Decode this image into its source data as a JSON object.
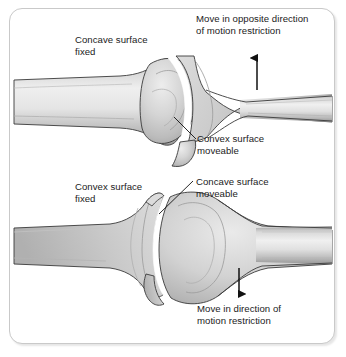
{
  "figure": {
    "border_color": "#c9c9c9",
    "background_color": "#ffffff",
    "bone_fill_light": "#e2e2e2",
    "bone_fill_mid": "#c4c4c4",
    "bone_fill_dark": "#9a9a9a",
    "outline_color": "#2b2b2b",
    "joint_space_color": "#ffffff",
    "text_color": "#1b1b1b"
  },
  "panels": [
    {
      "id": "top-panel",
      "name": "concave-fixed-convex-moveable",
      "labels": {
        "fixed_surface": "Concave surface\nfixed",
        "moveable_surface": "Convex surface\nmoveable",
        "direction_note": "Move in opposite direction\nof motion restriction"
      },
      "arrow": {
        "name": "up-arrow",
        "direction": "up",
        "x": 257,
        "y_tail": 90,
        "y_head": 52
      }
    },
    {
      "id": "bottom-panel",
      "name": "convex-fixed-concave-moveable",
      "labels": {
        "fixed_surface": "Convex surface\nfixed",
        "moveable_surface": "Concave surface\nmoveable",
        "direction_note": "Move in direction of\nmotion restriction"
      },
      "arrow": {
        "name": "down-arrow",
        "direction": "down",
        "x": 239,
        "y_tail": 268,
        "y_head": 300
      }
    }
  ],
  "leader_lines": [
    {
      "name": "leader-convex-moveable",
      "x1": 174,
      "y1": 117,
      "x2": 196,
      "y2": 139
    },
    {
      "name": "leader-concave-moveable",
      "x1": 193,
      "y1": 181,
      "x2": 159,
      "y2": 214
    }
  ]
}
